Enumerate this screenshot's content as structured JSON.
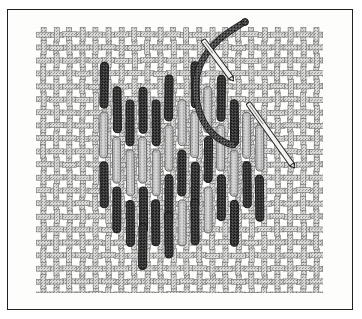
{
  "illustration": {
    "title": "Needlework stitch diagram",
    "subject": "vertical straight stitches worked in a diamond block on plain-weave ground fabric",
    "caption": "",
    "frame": {
      "border_color": "#23211f",
      "background_color": "#fdfdfc",
      "x": 7,
      "y": 9,
      "width": 346,
      "height": 301
    },
    "palette": {
      "paper": "#ffffff",
      "ink": "#23211f",
      "fabric_thread": "#8e8e8e",
      "fabric_thread_shade": "#6d6d6d",
      "fabric_gap": "#fbfbfa",
      "stitch_dark": "#3a3a3a",
      "stitch_dark_edge": "#1b1b1b",
      "stitch_light": "#b6b6b6",
      "stitch_light_edge": "#5f5f5f",
      "working_thread": "#4a4a4a",
      "working_thread_edge": "#1a1a1a",
      "needle_body": "#f2f2f0",
      "needle_edge": "#242424"
    },
    "fabric": {
      "name": "plain-weave ground fabric",
      "x": 37,
      "y": 28,
      "width": 285,
      "height": 264,
      "cell_size": 13,
      "thread_width": 5,
      "edge_style": "ragged fringed selvedge"
    },
    "stitch_block": {
      "name": "straight stitch diamond block",
      "shape": "diamond",
      "column_pitch": 13,
      "stitch_width": 8,
      "columns": [
        {
          "x": 104,
          "stitches": [
            {
              "y": 62,
              "length": 46,
              "tone": "dark"
            },
            {
              "y": 112,
              "length": 46,
              "tone": "light"
            },
            {
              "y": 162,
              "length": 46,
              "tone": "dark"
            }
          ]
        },
        {
          "x": 117,
          "stitches": [
            {
              "y": 87,
              "length": 46,
              "tone": "dark"
            },
            {
              "y": 137,
              "length": 46,
              "tone": "light"
            },
            {
              "y": 187,
              "length": 46,
              "tone": "dark"
            }
          ]
        },
        {
          "x": 130,
          "stitches": [
            {
              "y": 100,
              "length": 46,
              "tone": "dark"
            },
            {
              "y": 150,
              "length": 46,
              "tone": "light"
            },
            {
              "y": 200,
              "length": 46,
              "tone": "dark"
            }
          ]
        },
        {
          "x": 143,
          "stitches": [
            {
              "y": 87,
              "length": 46,
              "tone": "dark"
            },
            {
              "y": 137,
              "length": 46,
              "tone": "light"
            },
            {
              "y": 187,
              "length": 46,
              "tone": "dark"
            },
            {
              "y": 224,
              "length": 46,
              "tone": "dark"
            }
          ]
        },
        {
          "x": 156,
          "stitches": [
            {
              "y": 100,
              "length": 46,
              "tone": "dark"
            },
            {
              "y": 150,
              "length": 46,
              "tone": "light"
            },
            {
              "y": 200,
              "length": 46,
              "tone": "dark"
            }
          ]
        },
        {
          "x": 169,
          "stitches": [
            {
              "y": 75,
              "length": 46,
              "tone": "dark"
            },
            {
              "y": 125,
              "length": 46,
              "tone": "light"
            },
            {
              "y": 175,
              "length": 46,
              "tone": "dark"
            },
            {
              "y": 212,
              "length": 46,
              "tone": "dark"
            }
          ]
        },
        {
          "x": 182,
          "stitches": [
            {
              "y": 100,
              "length": 46,
              "tone": "light"
            },
            {
              "y": 150,
              "length": 46,
              "tone": "dark"
            },
            {
              "y": 200,
              "length": 46,
              "tone": "light"
            }
          ]
        },
        {
          "x": 195,
          "stitches": [
            {
              "y": 62,
              "length": 46,
              "tone": "dark"
            },
            {
              "y": 112,
              "length": 46,
              "tone": "light"
            },
            {
              "y": 162,
              "length": 46,
              "tone": "dark"
            },
            {
              "y": 199,
              "length": 46,
              "tone": "dark"
            }
          ]
        },
        {
          "x": 208,
          "stitches": [
            {
              "y": 87,
              "length": 46,
              "tone": "light"
            },
            {
              "y": 137,
              "length": 46,
              "tone": "dark"
            },
            {
              "y": 187,
              "length": 46,
              "tone": "light"
            }
          ]
        },
        {
          "x": 221,
          "stitches": [
            {
              "y": 75,
              "length": 46,
              "tone": "dark"
            },
            {
              "y": 125,
              "length": 46,
              "tone": "light"
            },
            {
              "y": 175,
              "length": 46,
              "tone": "dark"
            }
          ]
        },
        {
          "x": 234,
          "stitches": [
            {
              "y": 100,
              "length": 46,
              "tone": "dark"
            },
            {
              "y": 150,
              "length": 46,
              "tone": "light"
            },
            {
              "y": 200,
              "length": 46,
              "tone": "dark"
            }
          ]
        },
        {
          "x": 247,
          "stitches": [
            {
              "y": 112,
              "length": 46,
              "tone": "light"
            },
            {
              "y": 162,
              "length": 46,
              "tone": "dark"
            }
          ]
        },
        {
          "x": 260,
          "stitches": [
            {
              "y": 125,
              "length": 46,
              "tone": "light"
            },
            {
              "y": 175,
              "length": 46,
              "tone": "dark"
            }
          ]
        }
      ]
    },
    "working_thread": {
      "name": "working thread",
      "path": "M 243 23 C 228 32, 208 44, 199 68 C 191 92, 198 120, 214 135 C 222 142, 228 144, 233 145",
      "width": 5,
      "tail_tip": {
        "x": 245,
        "y": 22
      }
    },
    "needles": [
      {
        "name": "upper-needle",
        "x1": 203,
        "y1": 40,
        "x2": 232,
        "y2": 79,
        "width": 5,
        "angle_deg": 53
      },
      {
        "name": "lower-needle",
        "x1": 248,
        "y1": 103,
        "x2": 293,
        "y2": 166,
        "width": 5,
        "angle_deg": 54
      }
    ]
  }
}
